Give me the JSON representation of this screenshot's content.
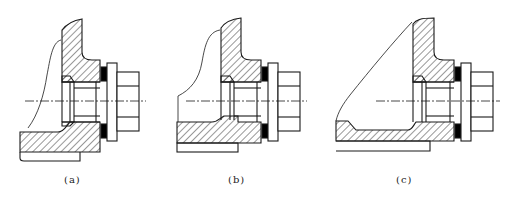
{
  "figure": {
    "stroke_color": "#1a1a1a",
    "seal_color": "#000000",
    "panels": [
      {
        "id": "a",
        "label": "(a)",
        "label_x": 64
      },
      {
        "id": "b",
        "label": "(b)",
        "label_x": 228
      },
      {
        "id": "c",
        "label": "(c)",
        "label_x": 396
      }
    ]
  }
}
